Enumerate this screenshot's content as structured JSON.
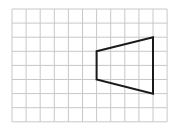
{
  "grid": {
    "origin_x": 12,
    "origin_y": 9,
    "cell_size": 14.1,
    "columns": 11,
    "rows": 8,
    "line_color": "#c8c8c8"
  },
  "shape": {
    "type": "trapezoid",
    "stroke_color": "#1a1a1a",
    "stroke_width": 2,
    "vertices_grid": [
      [
        6,
        3
      ],
      [
        10,
        2
      ],
      [
        10,
        6
      ],
      [
        6,
        5
      ]
    ]
  }
}
